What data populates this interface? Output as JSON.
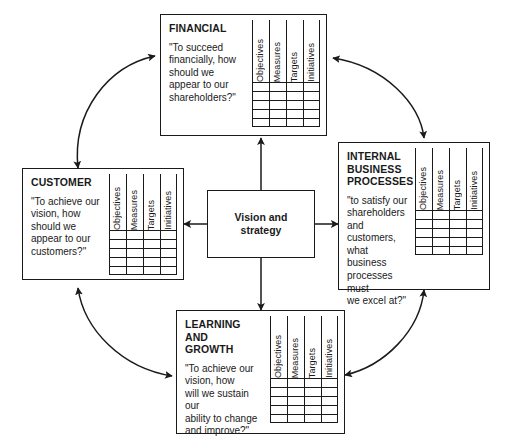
{
  "diagram": {
    "line_color": "#1a1a1a",
    "background_color": "#ffffff"
  },
  "center": {
    "label": "Vision and\nstrategy"
  },
  "scorecard_columns": [
    "Objectives",
    "Measures",
    "Targets",
    "Initiatives"
  ],
  "scorecard_row_count": 5,
  "perspectives": [
    {
      "id": "financial",
      "title": "FINANCIAL",
      "question": "\"To succeed\nfinancially, how\nshould we\nappear to our\nshareholders?\""
    },
    {
      "id": "customer",
      "title": "CUSTOMER",
      "question": "\"To achieve our\nvision, how\nshould we\nappear to our\ncustomers?\""
    },
    {
      "id": "internal-business-processes",
      "title": "INTERNAL BUSINESS\nPROCESSES",
      "question": "\"to satisfy our\nshareholders\nand customers,\nwhat business\nprocesses must\nwe excel at?\""
    },
    {
      "id": "learning-and-growth",
      "title": "LEARNING AND\nGROWTH",
      "question": "\"To achieve our\nvision, how\nwill we sustain our\nability to change\nand improve?\""
    }
  ]
}
